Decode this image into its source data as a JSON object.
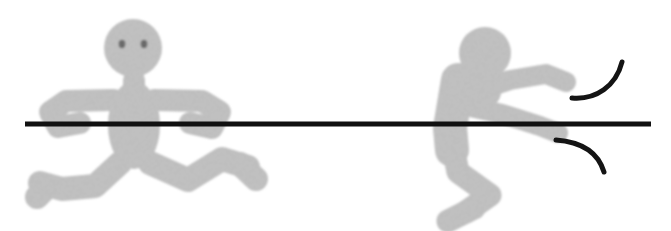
{
  "illustration": {
    "title": "Two stick figures at a horizontal line",
    "background_color": "#ffffff",
    "width": 671,
    "height": 231,
    "figure_fill_color": "#c9c9c9",
    "figure_edge_color": "#9e9e9e",
    "figure_shadow_color": "#b0b0b0",
    "line_color": "#111111",
    "eye_color": "#707070",
    "arc_color": "#141414",
    "texture": "grainy pencil shading"
  },
  "horizontal_line": {
    "name": "horizontal-bar",
    "x_start": 25,
    "x_end": 651,
    "y": 124,
    "thickness": 5,
    "color": "#111111"
  },
  "left_figure": {
    "name": "left-stick-figure",
    "pose": "facing viewer, arms spread wide, legs splayed in a crouch",
    "head": {
      "cx": 133,
      "cy": 48,
      "r": 29
    },
    "eyes": [
      {
        "cx": 122,
        "cy": 44,
        "r": 3.2
      },
      {
        "cx": 144,
        "cy": 44,
        "r": 3.2
      }
    ],
    "neck": {
      "x": 133,
      "y1": 76,
      "y2": 92
    },
    "torso": {
      "cx": 134,
      "cy": 125,
      "rx": 26,
      "ry": 44
    },
    "arms": [
      {
        "name": "left-arm",
        "points": "112,98 62,100 48,110 56,125 78,122"
      },
      {
        "name": "right-arm",
        "points": "156,98 206,100 222,110 214,126 192,122"
      }
    ],
    "legs": [
      {
        "name": "left-leg",
        "points": "118,165 92,186 60,188 38,182 36,195"
      },
      {
        "name": "right-leg",
        "points": "152,165 188,178 222,160 248,166 254,178"
      }
    ]
  },
  "right_figure": {
    "name": "right-stick-figure",
    "pose": "seated in profile, leaning forward, both arms reaching right across the line",
    "head": {
      "cx": 485,
      "cy": 53,
      "r": 26
    },
    "eyes": [],
    "torso": {
      "points": "452,84 448,128 452,156"
    },
    "arms": [
      {
        "name": "upper-arm-reaching",
        "points": "470,92 508,78 546,72 568,80"
      },
      {
        "name": "lower-arm-reaching",
        "points": "466,104 500,112 540,124 562,132"
      }
    ],
    "legs": [
      {
        "name": "folded-leg",
        "points": "448,140 460,176 488,196 470,212 448,222"
      }
    ]
  },
  "motion_arcs": [
    {
      "name": "upper-motion-arc",
      "path": "M 572,98 C 596,100 616,86 622,62",
      "color": "#141414",
      "thickness": 5
    },
    {
      "name": "lower-motion-arc",
      "path": "M 556,140 C 582,142 598,152 604,172",
      "color": "#141414",
      "thickness": 5
    }
  ]
}
